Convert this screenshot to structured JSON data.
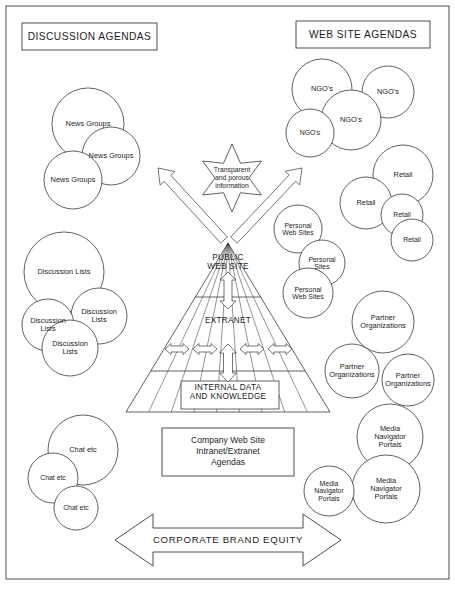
{
  "page": {
    "width": 455,
    "height": 596,
    "background": "#ffffff",
    "stroke": "#3a3a3a",
    "border": {
      "x": 6,
      "y": 6,
      "w": 443,
      "h": 573
    }
  },
  "headers": [
    {
      "name": "discussion-agendas",
      "label": "DISCUSSION AGENDAS",
      "x": 22,
      "y": 23,
      "w": 135,
      "h": 27
    },
    {
      "name": "web-site-agendas",
      "label": "WEB SITE AGENDAS",
      "x": 296,
      "y": 21,
      "w": 134,
      "h": 27
    }
  ],
  "star": {
    "label": "Transparent\nand porous\ninformation",
    "cx": 232,
    "cy": 178,
    "r_outer": 34,
    "r_inner": 17
  },
  "pyramid": {
    "apex": {
      "x": 228,
      "y": 243
    },
    "base_left": {
      "x": 126,
      "y": 412
    },
    "base_right": {
      "x": 330,
      "y": 412
    },
    "tiers": [
      {
        "label": "PUBLIC\nWEB SITE",
        "x": 228,
        "y": 262
      },
      {
        "label": "EXTRANET",
        "x": 228,
        "y": 320
      },
      {
        "label": "INTERNAL DATA\nAND KNOWLEDGE",
        "x": 228,
        "y": 392
      }
    ],
    "divider_y": [
      297,
      371
    ],
    "internal_box": {
      "x": 181,
      "y": 381,
      "w": 98,
      "h": 28
    }
  },
  "footer_box": {
    "label": "Company Web Site\nIntranet/Extranet\nAgendas",
    "x": 162,
    "y": 428,
    "w": 132,
    "h": 48
  },
  "banner": {
    "label": "CORPORATE BRAND EQUITY",
    "cx": 228,
    "cy": 540,
    "half_width": 113,
    "shaft_half_height": 12,
    "head_half_height": 26,
    "head_width": 38
  },
  "arrows": {
    "up_left": {
      "from": {
        "x": 224,
        "y": 240
      },
      "to": {
        "x": 158,
        "y": 168
      }
    },
    "up_right": {
      "from": {
        "x": 234,
        "y": 240
      },
      "to": {
        "x": 302,
        "y": 168
      }
    },
    "public_to_extranet": {
      "x": 228,
      "y_top": 272,
      "y_bottom": 309
    },
    "extranet_to_internal": {
      "x": 228,
      "y_top": 344,
      "y_bottom": 382
    },
    "extranet_lateral": [
      {
        "x": 177,
        "y": 349
      },
      {
        "x": 205,
        "y": 349
      },
      {
        "x": 252,
        "y": 349
      },
      {
        "x": 280,
        "y": 349
      }
    ]
  },
  "clusters": [
    {
      "name": "news-groups",
      "circles": [
        {
          "label": "News Groups",
          "cx": 88,
          "cy": 124,
          "r": 36
        },
        {
          "label": "News Groups",
          "cx": 111,
          "cy": 156,
          "r": 29
        },
        {
          "label": "News Groups",
          "cx": 73,
          "cy": 180,
          "r": 29
        }
      ]
    },
    {
      "name": "discussion-lists",
      "circles": [
        {
          "label": "Discussion Lists",
          "cx": 64,
          "cy": 272,
          "r": 40
        },
        {
          "label": "Discussion\nLists",
          "cx": 99,
          "cy": 316,
          "r": 28
        },
        {
          "label": "Discussion\nLists",
          "cx": 48,
          "cy": 325,
          "r": 26
        },
        {
          "label": "Discussion\nLists",
          "cx": 70,
          "cy": 348,
          "r": 28
        }
      ]
    },
    {
      "name": "chat-etc",
      "circles": [
        {
          "label": "Chat etc",
          "cx": 83,
          "cy": 450,
          "r": 35
        },
        {
          "label": "Chat etc",
          "cx": 53,
          "cy": 478,
          "r": 25
        },
        {
          "label": "Chat etc",
          "cx": 76,
          "cy": 508,
          "r": 22
        }
      ]
    },
    {
      "name": "ngos",
      "circles": [
        {
          "label": "NGO's",
          "cx": 322,
          "cy": 89,
          "r": 30
        },
        {
          "label": "NGO's",
          "cx": 388,
          "cy": 92,
          "r": 26
        },
        {
          "label": "NGO's",
          "cx": 351,
          "cy": 120,
          "r": 30
        },
        {
          "label": "NGO's",
          "cx": 310,
          "cy": 133,
          "r": 24
        }
      ]
    },
    {
      "name": "retail",
      "circles": [
        {
          "label": "Retail",
          "cx": 403,
          "cy": 175,
          "r": 30
        },
        {
          "label": "Retail",
          "cx": 366,
          "cy": 203,
          "r": 26
        },
        {
          "label": "Retail",
          "cx": 402,
          "cy": 215,
          "r": 21
        },
        {
          "label": "Retail",
          "cx": 412,
          "cy": 240,
          "r": 21
        }
      ]
    },
    {
      "name": "personal-web-sites",
      "circles": [
        {
          "label": "Personal\nWeb Sites",
          "cx": 298,
          "cy": 229,
          "r": 24
        },
        {
          "label": "Personal\nSites",
          "cx": 322,
          "cy": 263,
          "r": 23
        },
        {
          "label": "Personal\nWeb Sites",
          "cx": 308,
          "cy": 293,
          "r": 25
        }
      ]
    },
    {
      "name": "partner-organizations",
      "circles": [
        {
          "label": "Partner\nOrganizations",
          "cx": 383,
          "cy": 322,
          "r": 31
        },
        {
          "label": "Partner\nOrganizations",
          "cx": 352,
          "cy": 371,
          "r": 27
        },
        {
          "label": "Partner\nOrganizations",
          "cx": 408,
          "cy": 380,
          "r": 26
        }
      ]
    },
    {
      "name": "media-navigator-portals",
      "circles": [
        {
          "label": "Media\nNavigator\nPortals",
          "cx": 390,
          "cy": 437,
          "r": 33
        },
        {
          "label": "Media\nNavigator\nPortals",
          "cx": 386,
          "cy": 489,
          "r": 34
        },
        {
          "label": "Media\nNavigator\nPortals",
          "cx": 329,
          "cy": 491,
          "r": 25
        }
      ]
    }
  ]
}
